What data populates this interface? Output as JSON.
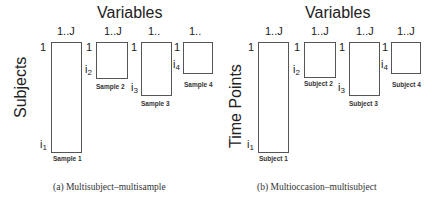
{
  "panels": [
    {
      "id": "a",
      "title": "Variables",
      "ylabel": "Subjects",
      "caption": "(a) Multisubject–multisample",
      "blocks": [
        {
          "col_label": "1..J",
          "row_start": "1",
          "row_end": "i",
          "row_end_sub": "1",
          "label": "Sample 1"
        },
        {
          "col_label": "1..J",
          "row_start": "1",
          "row_end": "i",
          "row_end_sub": "2",
          "label": "Sample 2"
        },
        {
          "col_label": "1..",
          "row_start": "1",
          "row_end": "i",
          "row_end_sub": "3",
          "label": "Sample 3"
        },
        {
          "col_label": "1..",
          "row_start": "1",
          "row_end": "i",
          "row_end_sub": "4",
          "label": "Sample 4"
        }
      ]
    },
    {
      "id": "b",
      "title": "Variables",
      "ylabel": "Time Points",
      "caption": "(b) Multioccasion–multisubject",
      "blocks": [
        {
          "col_label": "1..J",
          "row_start": "1",
          "row_end": "i",
          "row_end_sub": "1",
          "label": "Subject 1"
        },
        {
          "col_label": "1..J",
          "row_start": "1",
          "row_end": "i",
          "row_end_sub": "2",
          "label": "Subject  2"
        },
        {
          "col_label": "1..J",
          "row_start": "1",
          "row_end": "i",
          "row_end_sub": "3",
          "label": "Subject 3"
        },
        {
          "col_label": "1..J",
          "row_start": "1",
          "row_end": "i",
          "row_end_sub": "4",
          "label": "Subject 4"
        }
      ]
    }
  ]
}
